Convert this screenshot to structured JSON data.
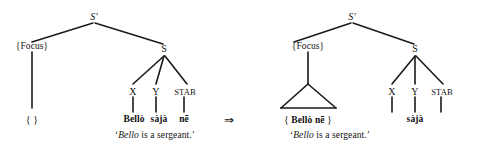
{
  "figure": {
    "type": "syntax-tree-derivation",
    "arrow_symbol": "⇒"
  },
  "left_tree": {
    "root": "S′",
    "focus_node": "{Focus}",
    "s_node": "S",
    "daughters": [
      "X",
      "Y",
      "STAB"
    ],
    "focus_terminal": "{    }",
    "terminals": [
      "Bellò",
      "sàjà",
      "nē"
    ],
    "gloss_open": "‘",
    "gloss_italic": "Bello",
    "gloss_rest": " is a sergeant.",
    "gloss_close": "’"
  },
  "right_tree": {
    "root": "S′",
    "focus_node": "{Focus}",
    "s_node": "S",
    "daughters": [
      "X",
      "Y",
      "STAB"
    ],
    "focus_open": "{",
    "focus_terminal_bold": "Bellò nē",
    "focus_close": "}",
    "terminals": [
      "",
      "sàjà",
      ""
    ],
    "gloss_open": "‘",
    "gloss_italic": "Bello",
    "gloss_rest": " is a sergeant.",
    "gloss_close": "’"
  },
  "colors": {
    "ink": "#111111",
    "background": "#ffffff"
  }
}
